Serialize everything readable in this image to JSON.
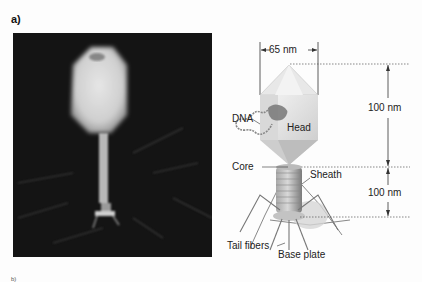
{
  "figure": {
    "panel_label": "a)",
    "micrograph": {
      "description": "electron micrograph of T4 bacteriophage"
    },
    "diagram": {
      "labels": {
        "width": "65 nm",
        "dna": "DNA",
        "head": "Head",
        "head_height": "100 nm",
        "core": "Core",
        "sheath": "Sheath",
        "tail_height": "100 nm",
        "tail_fibers": "Tail fibers",
        "base_plate": "Base plate"
      }
    },
    "next_panel_stub": "b)"
  }
}
